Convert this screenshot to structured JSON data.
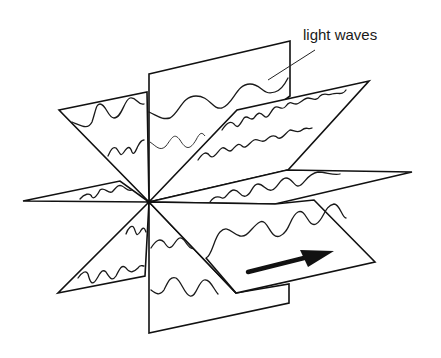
{
  "diagram": {
    "label": "light waves",
    "arrow": "direction-of-travel",
    "colors": {
      "ink": "#111111",
      "background": "#ffffff"
    },
    "planes": [
      {
        "id": "vertical",
        "orientation": "vertical"
      },
      {
        "id": "horizontal",
        "orientation": "horizontal"
      },
      {
        "id": "diagonal-a",
        "orientation": "upper-left / lower-right"
      },
      {
        "id": "diagonal-b",
        "orientation": "lower-left / upper-right"
      }
    ]
  }
}
